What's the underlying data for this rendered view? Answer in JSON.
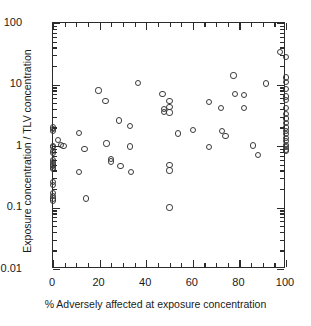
{
  "chart_data": {
    "type": "scatter",
    "title": "",
    "xlabel": "% Adversely affected at exposure concentration",
    "ylabel": "Exposure concentration / TLV concentration",
    "xlim": [
      0,
      100
    ],
    "ylim": [
      0.01,
      100
    ],
    "yscale": "log",
    "xscale": "linear",
    "grid": false,
    "legend": null,
    "x_major_ticks": [
      0,
      20,
      40,
      60,
      80,
      100
    ],
    "x_major_tick_labels": [
      "0",
      "20",
      "40",
      "60",
      "80",
      "100"
    ],
    "x_minor_tick_step": 5,
    "y_major_ticks": [
      0.01,
      0.1,
      1,
      10,
      100
    ],
    "y_major_tick_labels": [
      "0.01",
      "0.1",
      "1",
      "10",
      "100"
    ],
    "marker": "open-circle",
    "marker_color": "#3a3a3a",
    "points": [
      {
        "x": 0,
        "y": 2.0
      },
      {
        "x": 0,
        "y": 1.9
      },
      {
        "x": 0,
        "y": 1.75
      },
      {
        "x": 0,
        "y": 1.0
      },
      {
        "x": 0,
        "y": 0.95
      },
      {
        "x": 0,
        "y": 0.82
      },
      {
        "x": 0,
        "y": 0.78
      },
      {
        "x": 0,
        "y": 0.6
      },
      {
        "x": 0,
        "y": 0.55
      },
      {
        "x": 0,
        "y": 0.5
      },
      {
        "x": 0,
        "y": 0.47
      },
      {
        "x": 0,
        "y": 0.44
      },
      {
        "x": 0,
        "y": 0.42
      },
      {
        "x": 0,
        "y": 0.26
      },
      {
        "x": 0,
        "y": 0.23
      },
      {
        "x": 0,
        "y": 0.17
      },
      {
        "x": 0,
        "y": 0.155
      },
      {
        "x": 0,
        "y": 0.14
      },
      {
        "x": 0,
        "y": 0.13
      },
      {
        "x": 2,
        "y": 1.25
      },
      {
        "x": 3.5,
        "y": 1.05
      },
      {
        "x": 4.5,
        "y": 1.0
      },
      {
        "x": 11,
        "y": 1.65
      },
      {
        "x": 11,
        "y": 0.38
      },
      {
        "x": 13.5,
        "y": 0.9
      },
      {
        "x": 14,
        "y": 0.14
      },
      {
        "x": 19.5,
        "y": 8.0
      },
      {
        "x": 22.5,
        "y": 5.4
      },
      {
        "x": 23,
        "y": 1.1
      },
      {
        "x": 25,
        "y": 0.62
      },
      {
        "x": 25,
        "y": 0.56
      },
      {
        "x": 28.5,
        "y": 2.6
      },
      {
        "x": 29,
        "y": 0.48
      },
      {
        "x": 33,
        "y": 2.1
      },
      {
        "x": 33,
        "y": 0.98
      },
      {
        "x": 33.5,
        "y": 0.38
      },
      {
        "x": 36.5,
        "y": 10.5
      },
      {
        "x": 47,
        "y": 7.0
      },
      {
        "x": 47.5,
        "y": 4.0
      },
      {
        "x": 47.5,
        "y": 3.6
      },
      {
        "x": 50,
        "y": 5.4
      },
      {
        "x": 50,
        "y": 4.3
      },
      {
        "x": 50,
        "y": 3.5
      },
      {
        "x": 50,
        "y": 0.49
      },
      {
        "x": 50,
        "y": 0.4
      },
      {
        "x": 50,
        "y": 0.1
      },
      {
        "x": 53.5,
        "y": 1.6
      },
      {
        "x": 60,
        "y": 1.8
      },
      {
        "x": 67,
        "y": 5.2
      },
      {
        "x": 67,
        "y": 0.95
      },
      {
        "x": 72,
        "y": 4.1
      },
      {
        "x": 72.5,
        "y": 1.75
      },
      {
        "x": 74,
        "y": 1.45
      },
      {
        "x": 77.5,
        "y": 14.0
      },
      {
        "x": 78,
        "y": 7.0
      },
      {
        "x": 82,
        "y": 6.8
      },
      {
        "x": 82,
        "y": 4.2
      },
      {
        "x": 86,
        "y": 1.02
      },
      {
        "x": 88,
        "y": 0.72
      },
      {
        "x": 91.5,
        "y": 10.4
      },
      {
        "x": 97.5,
        "y": 34.0
      },
      {
        "x": 100,
        "y": 28.0
      },
      {
        "x": 100,
        "y": 13.0
      },
      {
        "x": 100,
        "y": 11.0
      },
      {
        "x": 100,
        "y": 8.5
      },
      {
        "x": 100,
        "y": 6.4
      },
      {
        "x": 100,
        "y": 5.6
      },
      {
        "x": 100,
        "y": 4.2
      },
      {
        "x": 100,
        "y": 3.3
      },
      {
        "x": 100,
        "y": 2.8
      },
      {
        "x": 100,
        "y": 2.4
      },
      {
        "x": 100,
        "y": 2.0
      },
      {
        "x": 100,
        "y": 1.75
      },
      {
        "x": 100,
        "y": 1.55
      },
      {
        "x": 100,
        "y": 1.35
      },
      {
        "x": 100,
        "y": 1.2
      },
      {
        "x": 100,
        "y": 1.05
      },
      {
        "x": 100,
        "y": 0.95
      },
      {
        "x": 100,
        "y": 0.88
      },
      {
        "x": 100,
        "y": 0.82
      }
    ]
  }
}
